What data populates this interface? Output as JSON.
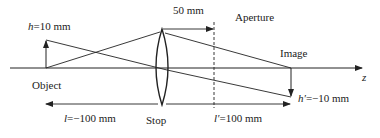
{
  "diagram": {
    "labels": {
      "object_height_var": "h",
      "object_height_val": "=10 mm",
      "stop_to_aperture": "50 mm",
      "aperture": "Aperture",
      "image": "Image",
      "axis": "z",
      "object": "Object",
      "object_distance_var": "l",
      "object_distance_val": "=−100 mm",
      "stop": "Stop",
      "image_distance_var": "l′",
      "image_distance_val": "=100 mm",
      "image_height_var": "h′",
      "image_height_val": "=−10 mm"
    },
    "colors": {
      "line": "#222222",
      "background": "#ffffff"
    }
  }
}
